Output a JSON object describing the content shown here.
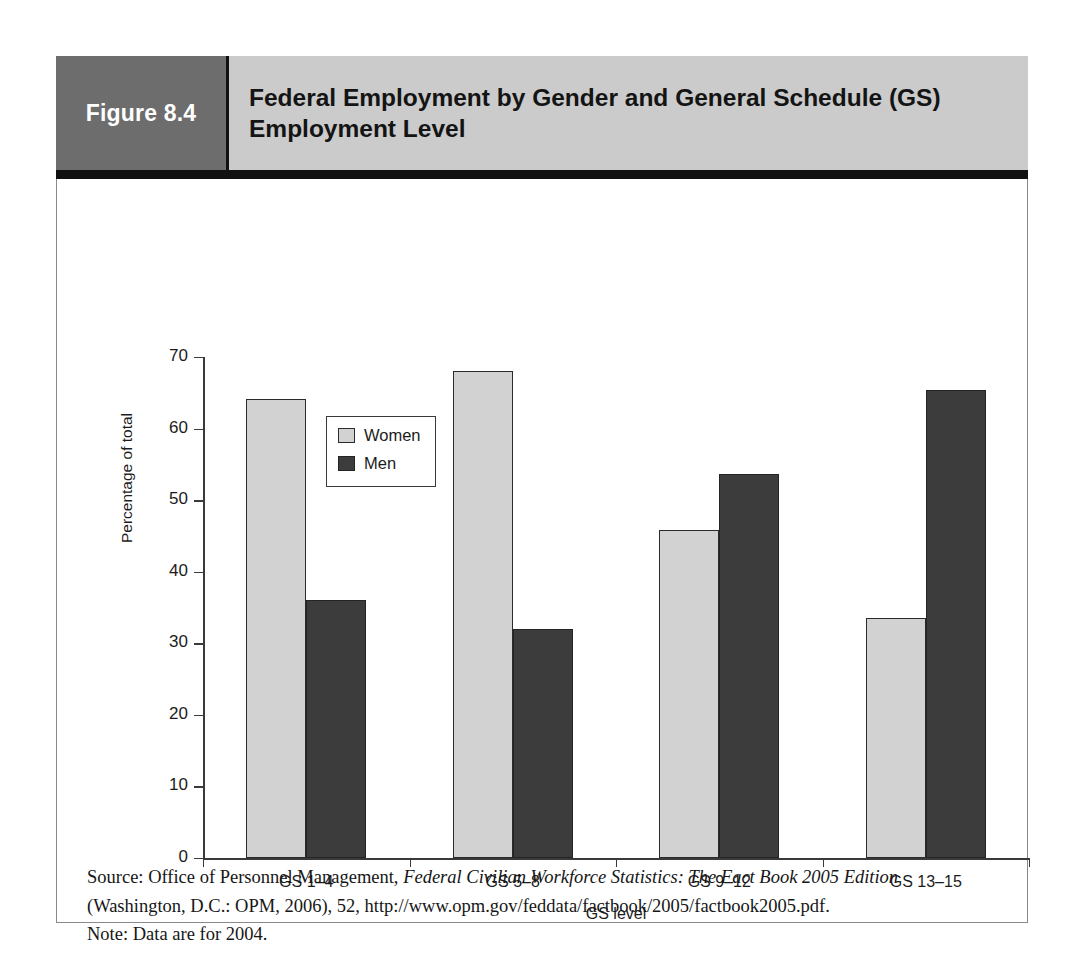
{
  "figure": {
    "number_label": "Figure 8.4",
    "title": "Federal Employment by Gender and General Schedule (GS) Employment Level"
  },
  "chart_data": {
    "type": "bar",
    "title": "Federal Employment by Gender and General Schedule (GS) Employment Level",
    "xlabel": "GS level",
    "ylabel": "Percentage of total",
    "ylim": [
      0,
      70
    ],
    "yticks": [
      0,
      10,
      20,
      30,
      40,
      50,
      60,
      70
    ],
    "grid": false,
    "legend_position": "upper-left-inside",
    "categories": [
      "GS 1–4",
      "GS 5–8",
      "GS 9–12",
      "GS 13–15"
    ],
    "series": [
      {
        "name": "Women",
        "color": "#d2d2d2",
        "values": [
          64.2,
          68.0,
          45.8,
          33.5
        ]
      },
      {
        "name": "Men",
        "color": "#3c3c3c",
        "values": [
          36.1,
          32.0,
          53.7,
          65.4
        ]
      }
    ]
  },
  "source": {
    "line1_prefix": "Source: Office of Personnel Management, ",
    "line1_italic": "Federal Civilian Workforce Statistics: The Fact Book 2005 Edition",
    "line2": "(Washington, D.C.: OPM, 2006), 52, http://www.opm.gov/feddata/factbook/2005/factbook2005.pdf.",
    "line3": "Note: Data are for 2004."
  }
}
